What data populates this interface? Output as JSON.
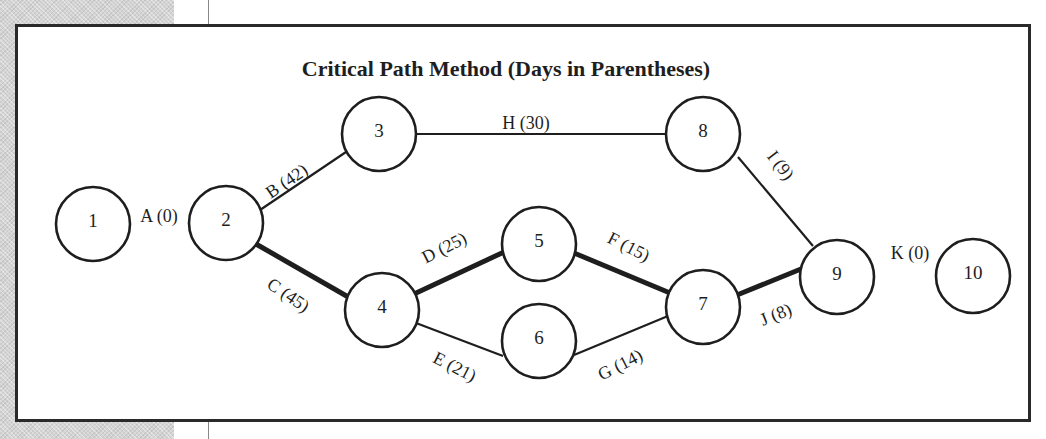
{
  "diagram": {
    "title": "Critical Path Method (Days in Parentheses)",
    "colors": {
      "stroke": "#1e1e1e",
      "background": "#ffffff",
      "side_strip": "#d4d4d4"
    },
    "nodes": [
      {
        "id": "1",
        "label": "1",
        "cx": 93,
        "cy": 224,
        "r": 37
      },
      {
        "id": "2",
        "label": "2",
        "cx": 226,
        "cy": 223,
        "r": 37
      },
      {
        "id": "3",
        "label": "3",
        "cx": 379,
        "cy": 134,
        "r": 37
      },
      {
        "id": "4",
        "label": "4",
        "cx": 382,
        "cy": 310,
        "r": 37
      },
      {
        "id": "5",
        "label": "5",
        "cx": 539,
        "cy": 244,
        "r": 37
      },
      {
        "id": "6",
        "label": "6",
        "cx": 539,
        "cy": 341,
        "r": 37
      },
      {
        "id": "7",
        "label": "7",
        "cx": 703,
        "cy": 307,
        "r": 37
      },
      {
        "id": "8",
        "label": "8",
        "cx": 703,
        "cy": 134,
        "r": 37
      },
      {
        "id": "9",
        "label": "9",
        "cx": 837,
        "cy": 277,
        "r": 37
      },
      {
        "id": "10",
        "label": "10",
        "cx": 973,
        "cy": 276,
        "r": 37
      }
    ],
    "edges": [
      {
        "id": "A",
        "activity": "A",
        "days": 0,
        "label": "A (0)",
        "from": "1",
        "to": "2",
        "critical": false,
        "drawn": false,
        "lx": 159,
        "ly": 222,
        "angle": 0
      },
      {
        "id": "B",
        "activity": "B",
        "days": 42,
        "label": "B (42)",
        "from": "2",
        "to": "3",
        "critical": false,
        "drawn": true,
        "lx": 290,
        "ly": 186,
        "angle": -34
      },
      {
        "id": "C",
        "activity": "C",
        "days": 45,
        "label": "C (45)",
        "from": "2",
        "to": "4",
        "critical": true,
        "drawn": true,
        "lx": 285,
        "ly": 300,
        "angle": 34
      },
      {
        "id": "D",
        "activity": "D",
        "days": 25,
        "label": "D (25)",
        "from": "4",
        "to": "5",
        "critical": true,
        "drawn": true,
        "lx": 447,
        "ly": 253,
        "angle": -27
      },
      {
        "id": "E",
        "activity": "E",
        "days": 21,
        "label": "E (21)",
        "from": "4",
        "to": "6",
        "critical": false,
        "drawn": true,
        "lx": 452,
        "ly": 372,
        "angle": 27
      },
      {
        "id": "F",
        "activity": "F",
        "days": 15,
        "label": "F (15)",
        "from": "5",
        "to": "7",
        "critical": true,
        "drawn": true,
        "lx": 626,
        "ly": 252,
        "angle": 27
      },
      {
        "id": "G",
        "activity": "G",
        "days": 14,
        "label": "G (14)",
        "from": "6",
        "to": "7",
        "critical": false,
        "drawn": true,
        "lx": 623,
        "ly": 370,
        "angle": -27
      },
      {
        "id": "H",
        "activity": "H",
        "days": 30,
        "label": "H (30)",
        "from": "3",
        "to": "8",
        "critical": false,
        "drawn": true,
        "lx": 526,
        "ly": 129,
        "angle": 0
      },
      {
        "id": "I",
        "activity": "I",
        "days": 9,
        "label": "I (9)",
        "from": "8",
        "to": "9",
        "critical": false,
        "drawn": true,
        "lx": 776,
        "ly": 169,
        "angle": 52
      },
      {
        "id": "J",
        "activity": "J",
        "days": 8,
        "label": "J (8)",
        "from": "7",
        "to": "9",
        "critical": true,
        "drawn": true,
        "lx": 778,
        "ly": 320,
        "angle": -22
      },
      {
        "id": "K",
        "activity": "K",
        "days": 0,
        "label": "K (0)",
        "from": "9",
        "to": "10",
        "critical": false,
        "drawn": false,
        "lx": 910,
        "ly": 259,
        "angle": 0
      }
    ],
    "edge_paths": {
      "B": {
        "x1": 260,
        "y1": 210,
        "x2": 346,
        "y2": 152
      },
      "C": {
        "x1": 256,
        "y1": 244,
        "x2": 350,
        "y2": 298
      },
      "D": {
        "x1": 414,
        "y1": 294,
        "x2": 504,
        "y2": 252
      },
      "E": {
        "x1": 416,
        "y1": 323,
        "x2": 503,
        "y2": 356
      },
      "F": {
        "x1": 574,
        "y1": 253,
        "x2": 670,
        "y2": 293
      },
      "G": {
        "x1": 574,
        "y1": 355,
        "x2": 668,
        "y2": 316
      },
      "H": {
        "x1": 416,
        "y1": 134,
        "x2": 666,
        "y2": 134
      },
      "I": {
        "x1": 738,
        "y1": 157,
        "x2": 813,
        "y2": 246
      },
      "J": {
        "x1": 737,
        "y1": 295,
        "x2": 801,
        "y2": 269
      }
    },
    "critical_path": [
      "A",
      "C",
      "D",
      "F",
      "J",
      "K"
    ]
  }
}
